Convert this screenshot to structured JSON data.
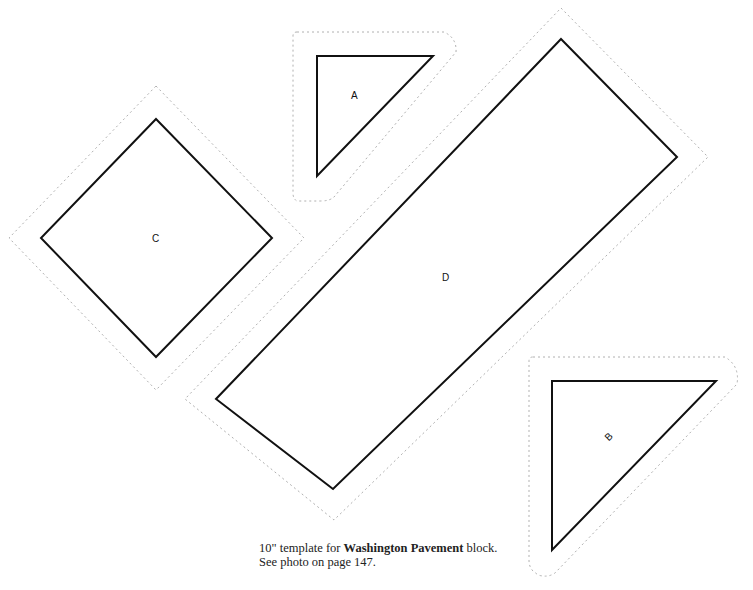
{
  "pieces": {
    "A": {
      "label": "A"
    },
    "B": {
      "label": "B"
    },
    "C": {
      "label": "C"
    },
    "D": {
      "label": "D"
    }
  },
  "caption": {
    "line1_prefix": "10\" template for ",
    "line1_bold": "Washington Pavement",
    "line1_suffix": " block.",
    "line2": "See photo on page 147."
  }
}
